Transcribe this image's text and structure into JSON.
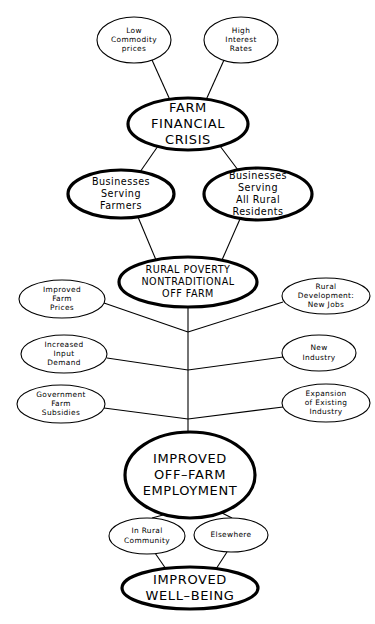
{
  "diagram": {
    "background_color": "#ffffff",
    "line_color": "#000000",
    "nodes": [
      {
        "id": "low-commodity-prices",
        "label": "Low\nCommodity\nprices",
        "lines": [
          "Low",
          "Commodity",
          "prices"
        ],
        "emphasis": "thin",
        "size": "small",
        "cx": 134,
        "cy": 40,
        "rx": 37,
        "ry": 23
      },
      {
        "id": "high-interest-rates",
        "label": "High\nInterest\nRates",
        "lines": [
          "High",
          "Interest",
          "Rates"
        ],
        "emphasis": "thin",
        "size": "small",
        "cx": 241,
        "cy": 40,
        "rx": 37,
        "ry": 23
      },
      {
        "id": "farm-financial-crisis",
        "label": "FARM\nFINANCIAL\nCRISIS",
        "lines": [
          "FARM",
          "FINANCIAL",
          "CRISIS"
        ],
        "emphasis": "bold",
        "size": "large",
        "cx": 188,
        "cy": 124,
        "rx": 60,
        "ry": 26
      },
      {
        "id": "businesses-serving-farmers",
        "label": "Businesses\nServing\nFarmers",
        "lines": [
          "Businesses",
          "Serving",
          "Farmers"
        ],
        "emphasis": "bold",
        "size": "med",
        "cx": 121,
        "cy": 194,
        "rx": 53,
        "ry": 24
      },
      {
        "id": "businesses-serving-all-rural-residents",
        "label": "Businesses\nServing\nAll Rural\nResidents",
        "lines": [
          "Businesses",
          "Serving",
          "All Rural",
          "Residents"
        ],
        "emphasis": "bold",
        "size": "med",
        "cx": 258,
        "cy": 194,
        "rx": 54,
        "ry": 26
      },
      {
        "id": "rural-poverty-nontraditional-off-farm",
        "label": "RURAL POVERTY\nNONTRADITIONAL\nOFF FARM",
        "lines": [
          "RURAL  POVERTY",
          "NONTRADITIONAL",
          "OFF  FARM"
        ],
        "emphasis": "bold",
        "size": "med",
        "cx": 188,
        "cy": 282,
        "rx": 69,
        "ry": 25
      },
      {
        "id": "improved-farm-prices",
        "label": "Improved\nFarm\nPrices",
        "lines": [
          "Improved",
          "Farm",
          "Prices"
        ],
        "emphasis": "thin",
        "size": "small",
        "cx": 62,
        "cy": 299,
        "rx": 43,
        "ry": 19
      },
      {
        "id": "rural-development-new-jobs",
        "label": "Rural\nDevelopment:\nNew Jobs",
        "lines": [
          "Rural",
          "Development:",
          "New  Jobs"
        ],
        "emphasis": "thin",
        "size": "small",
        "cx": 326,
        "cy": 296,
        "rx": 44,
        "ry": 18
      },
      {
        "id": "increased-input-demand",
        "label": "Increased\nInput\nDemand",
        "lines": [
          "Increased",
          "Input",
          "Demand"
        ],
        "emphasis": "thin",
        "size": "small",
        "cx": 64,
        "cy": 354,
        "rx": 43,
        "ry": 19
      },
      {
        "id": "new-industry",
        "label": "New\nIndustry",
        "lines": [
          "New",
          "Industry"
        ],
        "emphasis": "thin",
        "size": "small",
        "cx": 319,
        "cy": 353,
        "rx": 37,
        "ry": 18
      },
      {
        "id": "government-farm-subsidies",
        "label": "Government\nFarm\nSubsidies",
        "lines": [
          "Government",
          "Farm",
          "Subsidies"
        ],
        "emphasis": "thin",
        "size": "small",
        "cx": 61,
        "cy": 404,
        "rx": 44,
        "ry": 19
      },
      {
        "id": "expansion-of-existing-industry",
        "label": "Expansion\nof Existing\nIndustry",
        "lines": [
          "Expansion",
          "of  Existing",
          "Industry"
        ],
        "emphasis": "thin",
        "size": "small",
        "cx": 326,
        "cy": 403,
        "rx": 44,
        "ry": 19
      },
      {
        "id": "improved-off-farm-employment",
        "label": "IMPROVED\nOFF-FARM\nEMPLOYMENT",
        "lines": [
          "IMPROVED",
          "OFF–FARM",
          "EMPLOYMENT"
        ],
        "emphasis": "bold",
        "size": "large",
        "cx": 190,
        "cy": 475,
        "rx": 65,
        "ry": 43
      },
      {
        "id": "in-rural-community",
        "label": "In Rural\nCommunity",
        "lines": [
          "In  Rural",
          "Community"
        ],
        "emphasis": "thin",
        "size": "small",
        "cx": 147,
        "cy": 536,
        "rx": 38,
        "ry": 18
      },
      {
        "id": "elsewhere",
        "label": "Elsewhere",
        "lines": [
          "Elsewhere"
        ],
        "emphasis": "thin",
        "size": "small",
        "cx": 231,
        "cy": 535,
        "rx": 37,
        "ry": 17
      },
      {
        "id": "improved-well-being",
        "label": "IMPROVED\nWELL-BEING",
        "lines": [
          "IMPROVED",
          "WELL–BEING"
        ],
        "emphasis": "bold",
        "size": "large",
        "cx": 190,
        "cy": 588,
        "rx": 68,
        "ry": 21
      }
    ],
    "edges": [
      {
        "id": "edge-low-commodity-to-crisis",
        "from": "low-commodity-prices",
        "to": "farm-financial-crisis",
        "points": "152,60 170,100"
      },
      {
        "id": "edge-high-interest-to-crisis",
        "from": "high-interest-rates",
        "to": "farm-financial-crisis",
        "points": "224,60 206,100"
      },
      {
        "id": "edge-crisis-to-businesses-farmers",
        "from": "farm-financial-crisis",
        "to": "businesses-serving-farmers",
        "points": "158,146 140,172"
      },
      {
        "id": "edge-crisis-to-businesses-rural",
        "from": "farm-financial-crisis",
        "to": "businesses-serving-all-rural-residents",
        "points": "220,146 238,170"
      },
      {
        "id": "edge-businesses-farmers-to-poverty",
        "from": "businesses-serving-farmers",
        "to": "rural-poverty-nontraditional-off-farm",
        "points": "138,217 156,260"
      },
      {
        "id": "edge-businesses-rural-to-poverty",
        "from": "businesses-serving-all-rural-residents",
        "to": "rural-poverty-nontraditional-off-farm",
        "points": "240,219 222,260"
      },
      {
        "id": "edge-improved-farm-prices-to-spine",
        "from": "improved-farm-prices",
        "to": "spine-node-1",
        "points": "104,303 188,332"
      },
      {
        "id": "edge-rural-development-to-spine",
        "from": "rural-development-new-jobs",
        "to": "spine-node-1",
        "points": "283,302 188,332"
      },
      {
        "id": "edge-increased-input-demand-to-spine",
        "from": "increased-input-demand",
        "to": "spine-node-2",
        "points": "107,358 188,370"
      },
      {
        "id": "edge-new-industry-to-spine",
        "from": "new-industry",
        "to": "spine-node-2",
        "points": "283,357 188,370"
      },
      {
        "id": "edge-government-subsidies-to-spine",
        "from": "government-farm-subsidies",
        "to": "spine-node-3",
        "points": "104,408 188,419"
      },
      {
        "id": "edge-expansion-industry-to-spine",
        "from": "expansion-of-existing-industry",
        "to": "spine-node-3",
        "points": "283,407 188,419"
      },
      {
        "id": "edge-spine-vertical",
        "from": "rural-poverty-nontraditional-off-farm",
        "to": "improved-off-farm-employment",
        "points": "188,306 188,432"
      },
      {
        "id": "edge-employment-to-in-rural-community",
        "from": "improved-off-farm-employment",
        "to": "in-rural-community",
        "points": "163,515 152,518"
      },
      {
        "id": "edge-employment-to-elsewhere",
        "from": "improved-off-farm-employment",
        "to": "elsewhere",
        "points": "222,513 232,518"
      },
      {
        "id": "edge-in-rural-community-to-well-being",
        "from": "in-rural-community",
        "to": "improved-well-being",
        "points": "155,553 166,569"
      },
      {
        "id": "edge-elsewhere-to-well-being",
        "from": "elsewhere",
        "to": "improved-well-being",
        "points": "227,552 216,569"
      }
    ]
  }
}
